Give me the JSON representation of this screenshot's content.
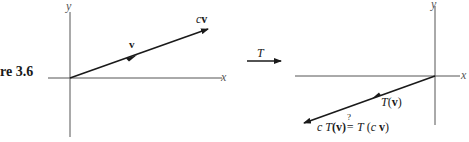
{
  "figure": {
    "caption_fragment": "re 3.6"
  },
  "left_panel": {
    "x_axis_label": "x",
    "y_axis_label": "y",
    "vector_label": "v",
    "scaled_vector_label_c": "c",
    "scaled_vector_label_v": "v"
  },
  "transform_arrow": {
    "label": "T"
  },
  "right_panel": {
    "x_axis_label": "x",
    "y_axis_label": "y",
    "image_vector_label_T": "T",
    "image_vector_label_open": "(",
    "image_vector_label_v": "v",
    "image_vector_label_close": ")",
    "equation": {
      "c": "c",
      "lhs_T": "T",
      "lhs_arg": "(v)",
      "question": "?",
      "equals": "=",
      "rhs_T": "T",
      "rhs_arg_open": "(",
      "rhs_c": "c",
      "rhs_v": "v",
      "rhs_arg_close": ")"
    }
  },
  "colors": {
    "ink": "#1a1a1a",
    "axis": "#444444",
    "background": "#ffffff"
  }
}
